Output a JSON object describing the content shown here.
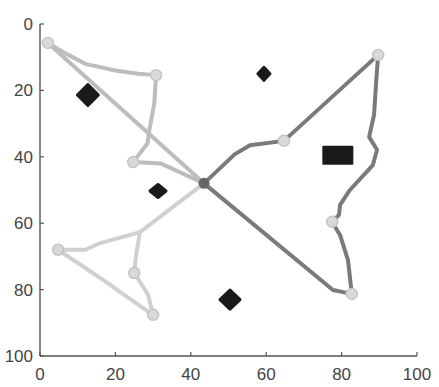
{
  "chart_data": {
    "type": "line",
    "title": "",
    "xlabel": "",
    "ylabel": "",
    "xlim": [
      0,
      100
    ],
    "ylim": [
      100,
      0
    ],
    "y_axis_inverted": true,
    "grid": false,
    "legend": null,
    "x_ticks": [
      "0",
      "20",
      "40",
      "60",
      "80",
      "100"
    ],
    "y_ticks": [
      "0",
      "20",
      "40",
      "60",
      "80",
      "100"
    ],
    "center_node": {
      "x": 43.5,
      "y": 48,
      "color": "#666666"
    },
    "series": [
      {
        "name": "path-upper-left",
        "color": "#bdbdbd",
        "nodes": [
          {
            "x": 2.1,
            "y": 5.7
          },
          {
            "x": 30.8,
            "y": 15.4
          },
          {
            "x": 24.7,
            "y": 41.6
          }
        ],
        "points": [
          [
            43.5,
            48
          ],
          [
            2.1,
            5.7
          ]
        ],
        "points2": [
          [
            2.1,
            5.7
          ],
          [
            7,
            9
          ],
          [
            12,
            12
          ],
          [
            20,
            14
          ],
          [
            26,
            15
          ],
          [
            30.8,
            15.4
          ],
          [
            30.3,
            24
          ],
          [
            29,
            32
          ],
          [
            28.5,
            36
          ],
          [
            24.7,
            41.6
          ],
          [
            32,
            42
          ],
          [
            43.5,
            48
          ]
        ]
      },
      {
        "name": "path-lower-left",
        "color": "#d0d0d0",
        "nodes": [
          {
            "x": 4.8,
            "y": 68
          },
          {
            "x": 25,
            "y": 75
          },
          {
            "x": 30,
            "y": 87.6
          }
        ],
        "points": [
          [
            43.5,
            48
          ],
          [
            26.5,
            62.7
          ],
          [
            16,
            66
          ],
          [
            12,
            68
          ],
          [
            4.8,
            68
          ],
          [
            16,
            76.5
          ],
          [
            21.2,
            80.7
          ],
          [
            30,
            87.6
          ]
        ],
        "points2": [
          [
            26.5,
            62.7
          ],
          [
            25.5,
            69.6
          ],
          [
            25,
            75
          ],
          [
            28.7,
            81.6
          ],
          [
            30,
            87.6
          ]
        ]
      },
      {
        "name": "path-upper-right",
        "color": "#7a7a7a",
        "nodes": [
          {
            "x": 64.7,
            "y": 35.2
          },
          {
            "x": 89.7,
            "y": 9.3
          }
        ],
        "points": [
          [
            43.5,
            48
          ],
          [
            51.7,
            39.2
          ],
          [
            55.7,
            36.5
          ],
          [
            64.7,
            35.2
          ],
          [
            89.7,
            9.3
          ],
          [
            89.2,
            16.9
          ],
          [
            88.6,
            27.4
          ],
          [
            87.3,
            34
          ],
          [
            89.4,
            37.9
          ],
          [
            88.3,
            42.5
          ],
          [
            82.2,
            50
          ],
          [
            79.6,
            54.5
          ],
          [
            79.3,
            57.5
          ],
          [
            77.5,
            59.6
          ]
        ]
      },
      {
        "name": "path-lower-right",
        "color": "#7a7a7a",
        "nodes": [
          {
            "x": 77.5,
            "y": 59.6
          },
          {
            "x": 82.7,
            "y": 81.3
          }
        ],
        "points": [
          [
            77.5,
            59.6
          ],
          [
            79.6,
            63.6
          ],
          [
            81.7,
            71.1
          ],
          [
            82.7,
            81.3
          ]
        ],
        "points2": [
          [
            43.5,
            48
          ],
          [
            77.7,
            80.1
          ],
          [
            82.7,
            81.3
          ]
        ]
      }
    ],
    "obstacles": [
      {
        "shape": "diamond",
        "x": 12.7,
        "y": 21.4,
        "w": 17,
        "h": 17
      },
      {
        "shape": "diamond",
        "x": 31.3,
        "y": 50.3,
        "w": 12,
        "h": 9
      },
      {
        "shape": "diamond",
        "x": 50.4,
        "y": 83,
        "w": 16,
        "h": 15
      },
      {
        "shape": "diamond",
        "x": 59.4,
        "y": 15,
        "w": 8,
        "h": 9
      },
      {
        "shape": "rect",
        "x": 79,
        "y": 39.5,
        "w": 31,
        "h": 19
      }
    ]
  }
}
